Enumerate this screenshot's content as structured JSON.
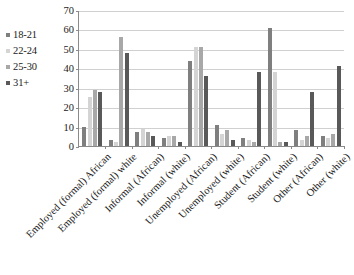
{
  "chart_data": {
    "type": "bar",
    "title": "",
    "subtitle": "",
    "xlabel": "",
    "ylabel": "",
    "ylim": [
      0,
      70
    ],
    "yticks": [
      0,
      10,
      20,
      30,
      40,
      50,
      60,
      70
    ],
    "grid": true,
    "legend_position": "top-left",
    "categories": [
      "Employed (formal) African",
      "Employed (formal) white",
      "Informal (African)",
      "Informal (white)",
      "Unemployed (African)",
      "Unemployed (white)",
      "Student (African)",
      "Student (white)",
      "Other (African)",
      "Other (white)"
    ],
    "series": [
      {
        "name": "18-21",
        "color": "#7f7f7f",
        "values": [
          10,
          3,
          7,
          4,
          44,
          11,
          4,
          61,
          8,
          5
        ]
      },
      {
        "name": "22-24",
        "color": "#d4d4d4",
        "values": [
          25,
          2,
          9,
          5,
          51,
          6,
          3,
          38,
          3,
          4
        ]
      },
      {
        "name": "25-30",
        "color": "#a8a8a8",
        "values": [
          29,
          56,
          7,
          5,
          51,
          8,
          2,
          2,
          5,
          6
        ]
      },
      {
        "name": "31+",
        "color": "#595959",
        "values": [
          28,
          48,
          5,
          2,
          36,
          3,
          38,
          2,
          28,
          41
        ]
      }
    ]
  },
  "legend": {
    "items": [
      {
        "label": "18-21",
        "color": "#7f7f7f"
      },
      {
        "label": "22-24",
        "color": "#d4d4d4"
      },
      {
        "label": "25-30",
        "color": "#a8a8a8"
      },
      {
        "label": "31+",
        "color": "#595959"
      }
    ]
  },
  "axis": {
    "y_max": 70,
    "y_min": 0,
    "y_step": 10,
    "axis_color": "#8a8a8a",
    "grid_color": "#d0d0d0"
  }
}
